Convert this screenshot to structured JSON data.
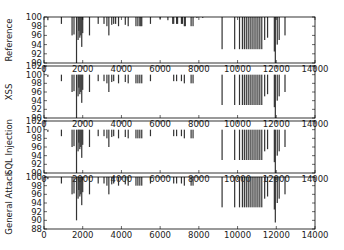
{
  "chart_data": {
    "type": "bar",
    "layout": "4 vertically stacked subplots sharing x axis",
    "x_ticks": [
      0,
      2000,
      4000,
      6000,
      8000,
      10000,
      12000,
      14000
    ],
    "xlim": [
      0,
      14000
    ],
    "bar_color": "#333333",
    "panels": [
      {
        "ylabel": "Reference",
        "ylim": [
          90,
          100
        ],
        "y_ticks": [
          90,
          92,
          94,
          96,
          98,
          100
        ],
        "bars": [
          [
            200,
            99.3
          ],
          [
            900,
            98.5
          ],
          [
            1450,
            96.0
          ],
          [
            1550,
            96.2
          ],
          [
            1680,
            90
          ],
          [
            1760,
            95.0
          ],
          [
            1800,
            97.0
          ],
          [
            1850,
            95.5
          ],
          [
            1900,
            96.0
          ],
          [
            1950,
            93.5
          ],
          [
            2000,
            96.5
          ],
          [
            2350,
            96.0
          ],
          [
            2800,
            98.5
          ],
          [
            3100,
            98.5
          ],
          [
            3250,
            98.0
          ],
          [
            3350,
            96.0
          ],
          [
            3500,
            98.3
          ],
          [
            3600,
            98.5
          ],
          [
            3700,
            98.5
          ],
          [
            3850,
            98.0
          ],
          [
            4200,
            98.3
          ],
          [
            4350,
            98.0
          ],
          [
            4750,
            98.0
          ],
          [
            4850,
            98.0
          ],
          [
            4950,
            98.0
          ],
          [
            5000,
            98.0
          ],
          [
            5050,
            98.0
          ],
          [
            5500,
            98.5
          ],
          [
            6000,
            99.6
          ],
          [
            6400,
            99.3
          ],
          [
            6650,
            98.5
          ],
          [
            6700,
            98.5
          ],
          [
            6850,
            98.5
          ],
          [
            6900,
            98.5
          ],
          [
            7100,
            98.5
          ],
          [
            7150,
            98.5
          ],
          [
            7250,
            98.0
          ],
          [
            7300,
            98.0
          ],
          [
            7600,
            98.0
          ],
          [
            7700,
            98.0
          ],
          [
            7900,
            99.8
          ],
          [
            8200,
            99.8
          ],
          [
            9200,
            93.0
          ],
          [
            9850,
            93.0
          ],
          [
            10100,
            93.0
          ],
          [
            10250,
            93.0
          ],
          [
            10350,
            93.0
          ],
          [
            10450,
            93.0
          ],
          [
            10550,
            93.0
          ],
          [
            10650,
            93.0
          ],
          [
            10750,
            93.0
          ],
          [
            10850,
            93.0
          ],
          [
            10950,
            93.0
          ],
          [
            11050,
            93.0
          ],
          [
            11150,
            93.0
          ],
          [
            11250,
            93.0
          ],
          [
            11400,
            95.0
          ],
          [
            11550,
            95.5
          ],
          [
            11900,
            92.5
          ],
          [
            11950,
            90
          ],
          [
            12050,
            94.0
          ],
          [
            12150,
            95.0
          ],
          [
            12450,
            96.0
          ]
        ]
      },
      {
        "ylabel": "XSS",
        "ylim": [
          90,
          102
        ],
        "y_ticks": [
          90,
          92,
          94,
          96,
          98,
          100,
          102
        ],
        "bars": [
          [
            200,
            99.5
          ],
          [
            900,
            98.5
          ],
          [
            1450,
            96.0
          ],
          [
            1550,
            96.2
          ],
          [
            1680,
            90
          ],
          [
            1760,
            95.0
          ],
          [
            1800,
            97.0
          ],
          [
            1850,
            95.5
          ],
          [
            1900,
            96.0
          ],
          [
            1950,
            93.5
          ],
          [
            2000,
            96.5
          ],
          [
            2350,
            96.0
          ],
          [
            2800,
            98.5
          ],
          [
            3100,
            98.5
          ],
          [
            3250,
            98.0
          ],
          [
            3350,
            96.0
          ],
          [
            3500,
            98.3
          ],
          [
            3600,
            98.5
          ],
          [
            3850,
            98.0
          ],
          [
            4200,
            98.3
          ],
          [
            4350,
            98.0
          ],
          [
            4750,
            98.0
          ],
          [
            4850,
            98.0
          ],
          [
            4950,
            98.0
          ],
          [
            5050,
            98.0
          ],
          [
            5500,
            98.5
          ],
          [
            6700,
            98.5
          ],
          [
            6850,
            98.5
          ],
          [
            7100,
            98.5
          ],
          [
            7250,
            98.0
          ],
          [
            7600,
            98.0
          ],
          [
            7700,
            98.0
          ],
          [
            9200,
            93.0
          ],
          [
            9850,
            93.0
          ],
          [
            10100,
            93.0
          ],
          [
            10250,
            93.0
          ],
          [
            10350,
            93.0
          ],
          [
            10450,
            93.0
          ],
          [
            10550,
            93.0
          ],
          [
            10650,
            93.0
          ],
          [
            10750,
            93.0
          ],
          [
            10850,
            93.0
          ],
          [
            10950,
            93.0
          ],
          [
            11050,
            93.0
          ],
          [
            11150,
            93.0
          ],
          [
            11250,
            93.0
          ],
          [
            11400,
            95.0
          ],
          [
            11550,
            95.5
          ],
          [
            11900,
            92.5
          ],
          [
            11950,
            90
          ],
          [
            12050,
            94.0
          ],
          [
            12150,
            95.0
          ],
          [
            12450,
            96.0
          ]
        ]
      },
      {
        "ylabel": "SQL Injection",
        "ylim": [
          90,
          102
        ],
        "y_ticks": [
          90,
          92,
          94,
          96,
          98,
          100,
          102
        ],
        "bars": [
          [
            200,
            99.5
          ],
          [
            900,
            98.5
          ],
          [
            1450,
            96.0
          ],
          [
            1550,
            96.2
          ],
          [
            1680,
            90
          ],
          [
            1760,
            95.0
          ],
          [
            1800,
            97.0
          ],
          [
            1850,
            95.5
          ],
          [
            1900,
            96.0
          ],
          [
            1950,
            93.5
          ],
          [
            2000,
            96.5
          ],
          [
            2350,
            96.0
          ],
          [
            2800,
            98.5
          ],
          [
            3100,
            98.5
          ],
          [
            3250,
            98.0
          ],
          [
            3350,
            96.0
          ],
          [
            3500,
            98.3
          ],
          [
            3600,
            98.5
          ],
          [
            3850,
            98.0
          ],
          [
            4200,
            98.3
          ],
          [
            4350,
            98.0
          ],
          [
            4750,
            98.0
          ],
          [
            4850,
            98.0
          ],
          [
            4950,
            98.0
          ],
          [
            5050,
            98.0
          ],
          [
            5500,
            98.5
          ],
          [
            6700,
            98.5
          ],
          [
            6850,
            98.5
          ],
          [
            7100,
            98.5
          ],
          [
            7250,
            98.0
          ],
          [
            7600,
            98.0
          ],
          [
            7700,
            98.0
          ],
          [
            9200,
            93.0
          ],
          [
            9850,
            93.0
          ],
          [
            10100,
            93.0
          ],
          [
            10250,
            93.0
          ],
          [
            10350,
            93.0
          ],
          [
            10450,
            93.0
          ],
          [
            10550,
            93.0
          ],
          [
            10650,
            93.0
          ],
          [
            10750,
            93.0
          ],
          [
            10850,
            93.0
          ],
          [
            10950,
            93.0
          ],
          [
            11050,
            93.0
          ],
          [
            11150,
            93.0
          ],
          [
            11250,
            93.0
          ],
          [
            11400,
            95.0
          ],
          [
            11550,
            95.5
          ],
          [
            11900,
            92.5
          ],
          [
            11950,
            90
          ],
          [
            12050,
            94.0
          ],
          [
            12150,
            95.0
          ],
          [
            12450,
            96.0
          ]
        ]
      },
      {
        "ylabel": "General Attack",
        "ylim": [
          88,
          100
        ],
        "y_ticks": [
          88,
          90,
          92,
          94,
          96,
          98,
          100
        ],
        "bars": [
          [
            200,
            99.5
          ],
          [
            900,
            98.5
          ],
          [
            1450,
            96.0
          ],
          [
            1550,
            96.2
          ],
          [
            1680,
            90
          ],
          [
            1760,
            95.0
          ],
          [
            1800,
            97.0
          ],
          [
            1850,
            95.5
          ],
          [
            1900,
            96.0
          ],
          [
            1950,
            93.5
          ],
          [
            2000,
            96.5
          ],
          [
            2350,
            96.0
          ],
          [
            2800,
            98.5
          ],
          [
            3100,
            98.5
          ],
          [
            3250,
            98.0
          ],
          [
            3350,
            96.0
          ],
          [
            3500,
            98.3
          ],
          [
            3600,
            98.5
          ],
          [
            3850,
            98.0
          ],
          [
            4200,
            98.3
          ],
          [
            4350,
            98.0
          ],
          [
            4750,
            98.0
          ],
          [
            4850,
            98.0
          ],
          [
            4950,
            98.0
          ],
          [
            5050,
            98.0
          ],
          [
            5500,
            98.5
          ],
          [
            6700,
            98.5
          ],
          [
            6850,
            98.5
          ],
          [
            7100,
            98.5
          ],
          [
            7250,
            98.0
          ],
          [
            7600,
            98.0
          ],
          [
            7700,
            98.0
          ],
          [
            9200,
            93.0
          ],
          [
            9850,
            93.0
          ],
          [
            10100,
            93.0
          ],
          [
            10250,
            93.0
          ],
          [
            10350,
            93.0
          ],
          [
            10450,
            93.0
          ],
          [
            10550,
            93.0
          ],
          [
            10650,
            93.0
          ],
          [
            10750,
            93.0
          ],
          [
            10850,
            93.0
          ],
          [
            10950,
            93.0
          ],
          [
            11050,
            93.0
          ],
          [
            11150,
            93.0
          ],
          [
            11250,
            93.0
          ],
          [
            11400,
            95.0
          ],
          [
            11550,
            95.5
          ],
          [
            11900,
            92.5
          ],
          [
            11950,
            89.5
          ],
          [
            12050,
            94.0
          ],
          [
            12150,
            95.0
          ],
          [
            12450,
            96.0
          ]
        ]
      }
    ],
    "grid": false,
    "legend": null
  },
  "layout_px": {
    "x0": 44,
    "x1": 315,
    "panels": [
      {
        "top": 17,
        "bottom": 63
      },
      {
        "top": 66,
        "bottom": 118
      },
      {
        "top": 121,
        "bottom": 173
      },
      {
        "top": 177,
        "bottom": 229
      }
    ]
  }
}
